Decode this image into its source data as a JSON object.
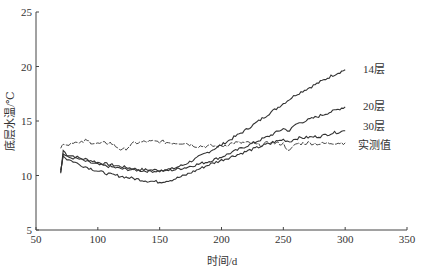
{
  "chart_data": {
    "type": "line",
    "title": "",
    "xlabel": "时间/d",
    "ylabel": "底层水温/℃",
    "xlim": [
      50,
      350
    ],
    "ylim": [
      5,
      25
    ],
    "xticks": [
      50,
      100,
      150,
      200,
      250,
      300,
      350
    ],
    "yticks": [
      5,
      10,
      15,
      20,
      25
    ],
    "grid": false,
    "legend_position": "inline-right",
    "x": [
      70,
      72,
      75,
      80,
      85,
      90,
      100,
      110,
      120,
      130,
      140,
      150,
      160,
      170,
      180,
      190,
      200,
      210,
      220,
      230,
      240,
      250,
      255,
      260,
      270,
      280,
      290,
      300
    ],
    "series": [
      {
        "name": "14层",
        "values": [
          10.2,
          12.3,
          11.9,
          11.8,
          11.6,
          11.5,
          11.2,
          11.0,
          10.8,
          10.6,
          10.5,
          10.5,
          10.6,
          11.0,
          11.6,
          12.2,
          12.8,
          13.5,
          14.2,
          15.0,
          15.8,
          16.6,
          17.0,
          17.4,
          18.0,
          18.6,
          19.2,
          19.7
        ]
      },
      {
        "name": "20层",
        "values": [
          10.3,
          12.0,
          11.7,
          11.6,
          11.5,
          11.3,
          11.0,
          10.8,
          10.6,
          10.5,
          10.4,
          10.4,
          10.5,
          10.7,
          11.0,
          11.3,
          11.7,
          12.2,
          12.7,
          13.2,
          13.7,
          14.3,
          14.1,
          14.7,
          15.1,
          15.5,
          15.9,
          16.3
        ]
      },
      {
        "name": "30层",
        "values": [
          10.5,
          11.8,
          11.5,
          11.3,
          11.0,
          10.8,
          10.4,
          10.1,
          9.9,
          9.7,
          9.5,
          9.4,
          9.6,
          10.0,
          10.5,
          11.0,
          11.4,
          11.8,
          12.2,
          12.6,
          13.0,
          13.3,
          13.1,
          13.4,
          13.5,
          13.6,
          13.9,
          14.1
        ]
      },
      {
        "name": "实测值",
        "values": [
          12.5,
          13.0,
          12.8,
          13.1,
          12.9,
          13.2,
          12.9,
          13.0,
          12.3,
          13.0,
          13.1,
          13.1,
          13.0,
          13.0,
          12.7,
          12.7,
          12.7,
          13.0,
          13.0,
          12.8,
          13.0,
          12.9,
          12.2,
          12.9,
          13.0,
          12.9,
          13.0,
          13.0
        ]
      }
    ],
    "line_color": "#333333"
  },
  "labels": {
    "series_14": "14层",
    "series_20": "20层",
    "series_30": "30层",
    "series_measured": "实测值",
    "xlabel": "时间/d",
    "ylabel": "底层水温/℃"
  }
}
